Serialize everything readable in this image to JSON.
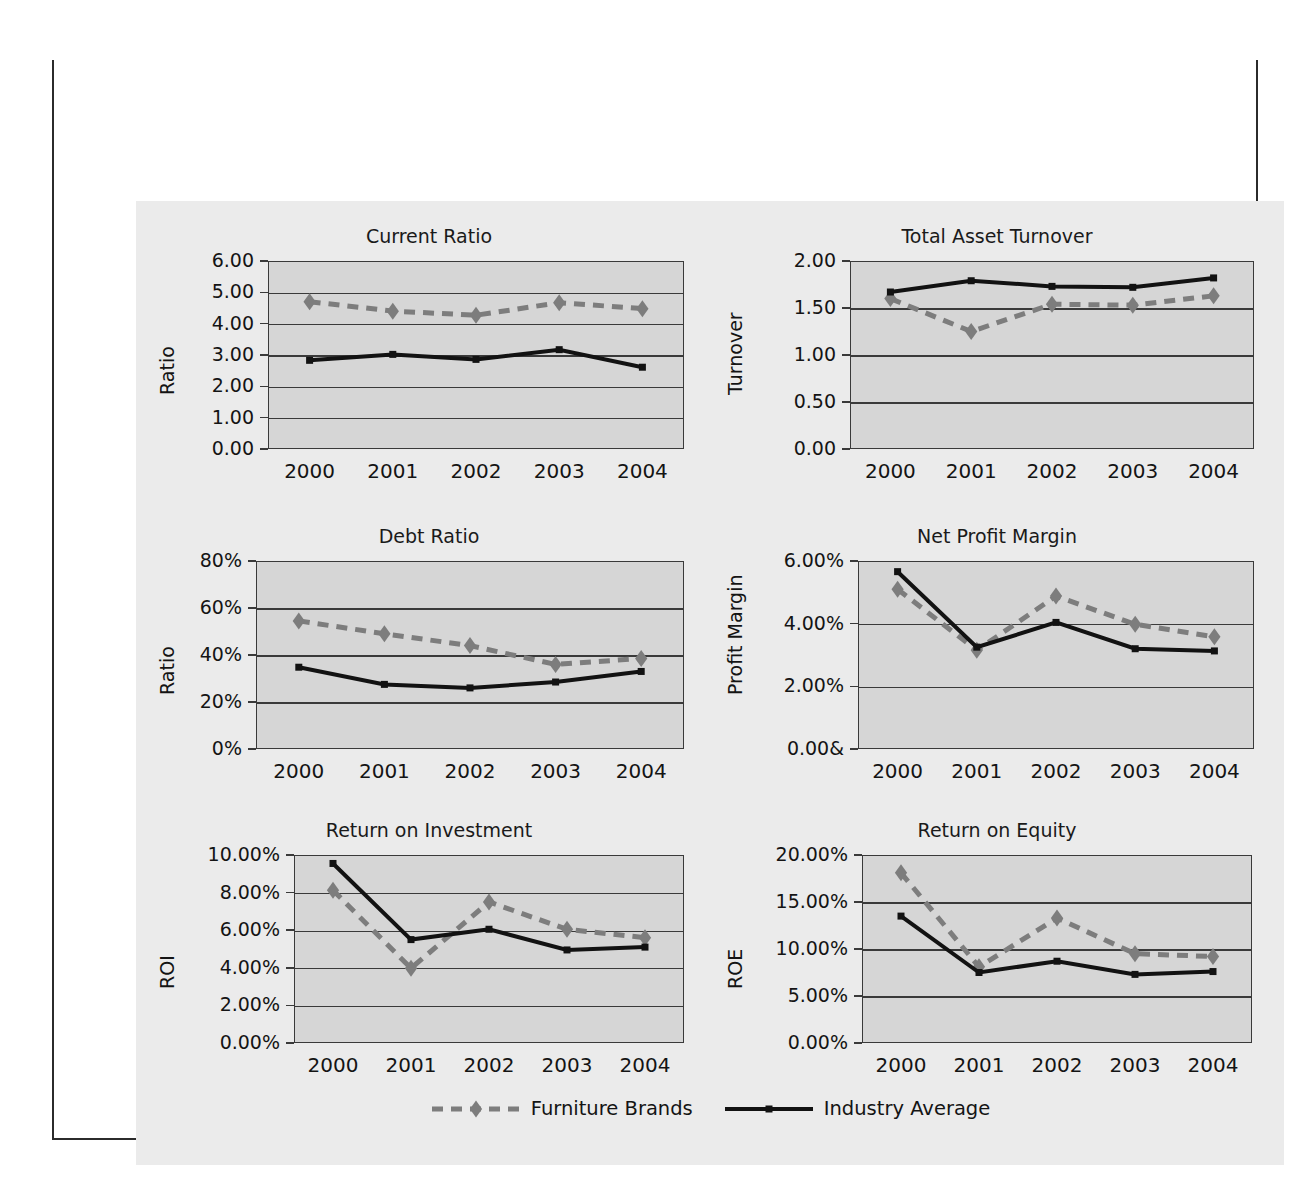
{
  "figure": {
    "title": "Figure 4.1  Trend Analysis of Financial Ratios for Furniture Brands 2000–2004",
    "title_bar_color": "#1c1c1c",
    "frame_border_color": "#2b2b2b",
    "panel_background": "#ebebeb",
    "plot_background": "#d6d6d6"
  },
  "legend": {
    "entries": [
      {
        "label": "Furniture Brands",
        "color": "#7d7d7d",
        "marker": "diamond",
        "line": "dashed"
      },
      {
        "label": "Industry Average",
        "color": "#121212",
        "marker": "square",
        "line": "solid"
      }
    ]
  },
  "series_names": {
    "furniture_brands": "Furniture Brands",
    "industry_average": "Industry Average"
  },
  "chart_data": [
    {
      "type": "line",
      "title": "Current Ratio",
      "xlabel": "",
      "ylabel": "Ratio",
      "categories": [
        "2000",
        "2001",
        "2002",
        "2003",
        "2004"
      ],
      "ytick_labels": [
        "6.00",
        "5.00",
        "4.00",
        "3.00",
        "2.00",
        "1.00",
        "0.00"
      ],
      "ylim": [
        0,
        6
      ],
      "ytick_step": 1,
      "grid": true,
      "legend_position": "figure-bottom",
      "series": [
        {
          "name": "Furniture Brands",
          "values": [
            4.7,
            4.4,
            4.27,
            4.67,
            4.48
          ]
        },
        {
          "name": "Industry Average",
          "values": [
            2.83,
            3.02,
            2.86,
            3.17,
            2.61
          ]
        }
      ]
    },
    {
      "type": "line",
      "title": "Total Asset Turnover",
      "xlabel": "",
      "ylabel": "Turnover",
      "categories": [
        "2000",
        "2001",
        "2002",
        "2003",
        "2004"
      ],
      "ytick_labels": [
        "2.00",
        "1.50",
        "1.00",
        "0.50",
        "0.00"
      ],
      "ylim": [
        0,
        2
      ],
      "ytick_step": 0.5,
      "grid": true,
      "legend_position": "figure-bottom",
      "series": [
        {
          "name": "Furniture Brands",
          "values": [
            1.6,
            1.25,
            1.54,
            1.53,
            1.63
          ]
        },
        {
          "name": "Industry Average",
          "values": [
            1.67,
            1.79,
            1.73,
            1.72,
            1.82
          ]
        }
      ]
    },
    {
      "type": "line",
      "title": "Debt Ratio",
      "xlabel": "",
      "ylabel": "Ratio",
      "categories": [
        "2000",
        "2001",
        "2002",
        "2003",
        "2004"
      ],
      "ytick_labels": [
        "80%",
        "60%",
        "40%",
        "20%",
        "0%"
      ],
      "ylim": [
        0,
        80
      ],
      "ytick_step": 20,
      "grid": true,
      "legend_position": "figure-bottom",
      "series": [
        {
          "name": "Furniture Brands",
          "values": [
            54.5,
            49.0,
            44.0,
            36.0,
            38.5
          ]
        },
        {
          "name": "Industry Average",
          "values": [
            34.8,
            27.5,
            26.0,
            28.5,
            33.0
          ]
        }
      ]
    },
    {
      "type": "line",
      "title": "Net Profit Margin",
      "xlabel": "",
      "ylabel": "Profit Margin",
      "categories": [
        "2000",
        "2001",
        "2002",
        "2003",
        "2004"
      ],
      "ytick_labels": [
        "6.00%",
        "4.00%",
        "2.00%",
        "0.00&"
      ],
      "ylim": [
        0,
        6
      ],
      "ytick_step": 2,
      "grid": true,
      "legend_position": "figure-bottom",
      "series": [
        {
          "name": "Furniture Brands",
          "values": [
            5.1,
            3.15,
            4.88,
            3.98,
            3.58
          ]
        },
        {
          "name": "Industry Average",
          "values": [
            5.66,
            3.25,
            4.04,
            3.2,
            3.13
          ]
        }
      ]
    },
    {
      "type": "line",
      "title": "Return on Investment",
      "xlabel": "",
      "ylabel": "ROI",
      "categories": [
        "2000",
        "2001",
        "2002",
        "2003",
        "2004"
      ],
      "ytick_labels": [
        "10.00%",
        "8.00%",
        "6.00%",
        "4.00%",
        "2.00%",
        "0.00%"
      ],
      "ylim": [
        0,
        10
      ],
      "ytick_step": 2,
      "grid": true,
      "legend_position": "figure-bottom",
      "series": [
        {
          "name": "Furniture Brands",
          "values": [
            8.12,
            3.98,
            7.5,
            6.05,
            5.6
          ]
        },
        {
          "name": "Industry Average",
          "values": [
            9.55,
            5.5,
            6.05,
            4.95,
            5.1
          ]
        }
      ]
    },
    {
      "type": "line",
      "title": "Return on Equity",
      "xlabel": "",
      "ylabel": "ROE",
      "categories": [
        "2000",
        "2001",
        "2002",
        "2003",
        "2004"
      ],
      "ytick_labels": [
        "20.00%",
        "15.00%",
        "10.00%",
        "5.00%",
        "0.00%"
      ],
      "ylim": [
        0,
        20
      ],
      "ytick_step": 5,
      "grid": true,
      "legend_position": "figure-bottom",
      "series": [
        {
          "name": "Furniture Brands",
          "values": [
            18.1,
            8.1,
            13.3,
            9.5,
            9.2
          ]
        },
        {
          "name": "Industry Average",
          "values": [
            13.5,
            7.5,
            8.7,
            7.3,
            7.6
          ]
        }
      ]
    }
  ]
}
